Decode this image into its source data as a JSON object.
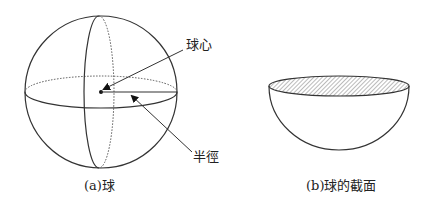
{
  "figure_a": {
    "caption": "(a)球",
    "labels": {
      "center": "球心",
      "radius": "半徑"
    }
  },
  "figure_b": {
    "caption": "(b)球的截面"
  },
  "colors": {
    "stroke": "#333333",
    "hatch": "#777777",
    "background": "#ffffff"
  }
}
